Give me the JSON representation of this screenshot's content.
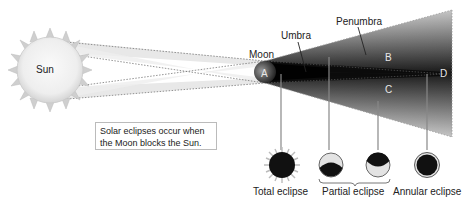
{
  "diagram": {
    "bodies": {
      "sun_label": "Sun",
      "moon_label": "Moon"
    },
    "shadow_labels": {
      "umbra": "Umbra",
      "penumbra": "Penumbra"
    },
    "regions": {
      "a": "A",
      "b": "B",
      "c": "C",
      "d": "D"
    },
    "note": {
      "line1": "Solar eclipses occur when",
      "line2": "the Moon blocks the Sun."
    },
    "eclipse_types": [
      {
        "label": "Total eclipse",
        "region": "A"
      },
      {
        "label": "Partial eclipse",
        "region": "B / C"
      },
      {
        "label": "Annular eclipse",
        "region": "D"
      }
    ],
    "colors": {
      "sun_fill": "#f2f2f2",
      "sun_rays": "#c8c8c8",
      "umbra": "#111111",
      "penumbra_edge": "#d9d9d9",
      "light_cone": "#e6e6e6",
      "dotted_line": "#777777"
    }
  }
}
